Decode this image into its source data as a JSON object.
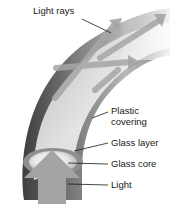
{
  "labels": {
    "light_rays": "Light rays",
    "plastic_covering_line1": "Plastic",
    "plastic_covering_line2": "covering",
    "glass_layer": "Glass layer",
    "glass_core": "Glass core",
    "light": "Light"
  },
  "colors": {
    "background": "#ffffff",
    "covering_dark": "#5a5a5a",
    "glass_layer": "#9a9a9a",
    "core_light": "#e8e8e8",
    "arrow": "#a8a8a8",
    "leader_line": "#1a1a1a"
  }
}
